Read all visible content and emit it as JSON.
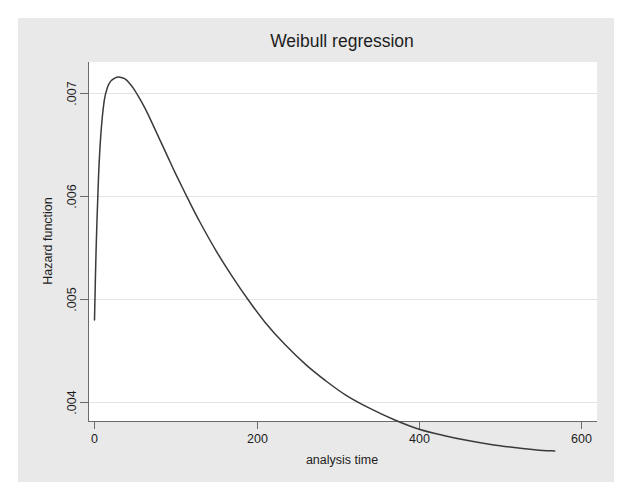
{
  "chart_data": {
    "type": "line",
    "title": "Weibull regression",
    "xlabel": "analysis time",
    "ylabel": "Hazard function",
    "xlim": [
      0,
      600
    ],
    "ylim": [
      0.0037,
      0.00745
    ],
    "grid": true,
    "grid_axis": "y",
    "legend": null,
    "xticks": [
      0,
      200,
      400,
      600
    ],
    "xticklabels": [
      "0",
      "200",
      "400",
      "600"
    ],
    "yticks": [
      0.004,
      0.005,
      0.006,
      0.007
    ],
    "yticklabels": [
      ".004",
      ".005",
      ".006",
      ".007"
    ],
    "series": [
      {
        "name": "Hazard function",
        "color": "#3a3a3a",
        "x": [
          0,
          2,
          5,
          8,
          12,
          16,
          20,
          25,
          30,
          35,
          38,
          42,
          48,
          55,
          62,
          70,
          80,
          90,
          100,
          115,
          130,
          150,
          170,
          190,
          210,
          235,
          260,
          285,
          310,
          340,
          370,
          400,
          430,
          460,
          490,
          520,
          545,
          567
        ],
        "y": [
          0.0048,
          0.00549,
          0.0062,
          0.00662,
          0.00693,
          0.00706,
          0.00712,
          0.00715,
          0.00716,
          0.00715,
          0.00714,
          0.00711,
          0.00705,
          0.00696,
          0.00686,
          0.00673,
          0.00656,
          0.00639,
          0.00622,
          0.00598,
          0.00575,
          0.00547,
          0.00522,
          0.00499,
          0.00478,
          0.00456,
          0.00437,
          0.00421,
          0.00407,
          0.00394,
          0.00383,
          0.00374,
          0.00368,
          0.00363,
          0.00359,
          0.00356,
          0.00354,
          0.00353
        ]
      }
    ],
    "annotations": {
      "peak_x": 38,
      "peak_y": 0.00716,
      "start_y": 0.0048,
      "end_x": 567,
      "end_y": 0.00392
    }
  },
  "title": "Weibull regression",
  "axes": {
    "x_label": "analysis time",
    "y_label": "Hazard function",
    "x_ticks": [
      "0",
      "200",
      "400",
      "600"
    ],
    "y_ticks": [
      ".007",
      ".006",
      ".005",
      ".004"
    ]
  },
  "colors": {
    "background": "#ffffff",
    "graph_region": "#e9e9e9",
    "plot_region": "#ffffff",
    "line": "#3a3a3a",
    "grid": "#e3e3e3",
    "axis": "#6a6a6a",
    "text": "#1d1d1d"
  }
}
